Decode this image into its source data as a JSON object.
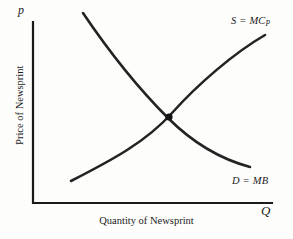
{
  "figure": {
    "background_color": "#fdfdfc",
    "ink_color": "#1a1a1a",
    "curve_color": "#232323"
  },
  "axes": {
    "y_symbol": "p",
    "x_symbol": "Q",
    "y_title": "Price of Newsprint",
    "x_title": "Quantity of Newsprint",
    "origin": {
      "x": 33,
      "y": 203
    },
    "y_top": 22,
    "x_right": 272,
    "line_width": 2.2
  },
  "curves": {
    "supply": {
      "label": "S = MC",
      "label_subscript": "P",
      "meaning": "Supply equals private marginal cost",
      "start": {
        "x": 71,
        "y": 181
      },
      "end": {
        "x": 265,
        "y": 35
      },
      "path": "M 71 181 C 112 160, 146 142, 172 113 C 198 84, 234 53, 265 35",
      "stroke_width": 2.6
    },
    "demand": {
      "label": "D = MB",
      "meaning": "Demand equals marginal benefit",
      "start": {
        "x": 83,
        "y": 13
      },
      "end": {
        "x": 250,
        "y": 167
      },
      "path": "M 83 13 C 112 56, 140 90, 168 118 C 196 146, 224 160, 250 167",
      "stroke_width": 2.6
    }
  },
  "equilibrium": {
    "label": "equilibrium point",
    "x": 169,
    "y": 117,
    "radius": 3.6
  },
  "chart_data": {
    "type": "line",
    "title": "",
    "subtitle": "",
    "xlabel": "Quantity of Newsprint",
    "ylabel": "Price of Newsprint",
    "x_axis_symbol": "Q",
    "y_axis_symbol": "p",
    "grid": false,
    "legend_position": "inline-curve-labels",
    "xlim": [
      0,
      1
    ],
    "ylim": [
      0,
      1
    ],
    "axis_ticks": {
      "x": [],
      "y": []
    },
    "series": [
      {
        "name": "S = MC_P",
        "display_label": "S = MC",
        "subscript": "P",
        "description": "Upward-sloping supply curve, convex; private marginal cost",
        "x": [
          0.16,
          0.3,
          0.43,
          0.58,
          0.72,
          0.85,
          0.97
        ],
        "y": [
          0.12,
          0.22,
          0.31,
          0.48,
          0.63,
          0.78,
          0.93
        ]
      },
      {
        "name": "D = MB",
        "display_label": "D = MB",
        "description": "Downward-sloping demand curve, convex to origin; marginal benefit",
        "x": [
          0.21,
          0.33,
          0.45,
          0.57,
          0.7,
          0.82,
          0.91
        ],
        "y": [
          0.95,
          0.77,
          0.62,
          0.47,
          0.34,
          0.25,
          0.2
        ]
      }
    ],
    "annotations": [
      {
        "type": "point",
        "label": "equilibrium",
        "x": 0.57,
        "y": 0.47,
        "marker": "filled-dot"
      },
      {
        "type": "text",
        "label": "S = MC_P",
        "x": 0.86,
        "y": 0.99
      },
      {
        "type": "text",
        "label": "D = MB",
        "x": 0.86,
        "y": 0.17
      }
    ]
  }
}
